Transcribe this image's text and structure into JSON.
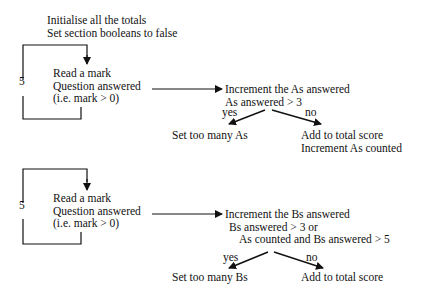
{
  "diagram": {
    "type": "flowchart",
    "colors": {
      "ink": "#111111",
      "background": "#ffffff"
    },
    "section_a": {
      "init": [
        "Initialise all the totals",
        "Set section booleans to false"
      ],
      "loop_count": "5",
      "read": [
        "Read a mark",
        "Question answered",
        "(i.e. mark > 0)"
      ],
      "decision": [
        "Increment the As answered",
        "As answered > 3"
      ],
      "yes_label": "yes",
      "no_label": "no",
      "yes_action": [
        "Set too many As"
      ],
      "no_action": [
        "Add to total score",
        "Increment As counted"
      ]
    },
    "section_b": {
      "loop_count": "5",
      "read": [
        "Read a mark",
        "Question answered",
        "(i.e. mark > 0)"
      ],
      "decision": [
        "Increment the Bs answered",
        "Bs answered > 3 or",
        "As counted and Bs answered > 5"
      ],
      "yes_label": "yes",
      "no_label": "no",
      "yes_action": [
        "Set too many Bs"
      ],
      "no_action": [
        "Add to total score"
      ]
    }
  }
}
